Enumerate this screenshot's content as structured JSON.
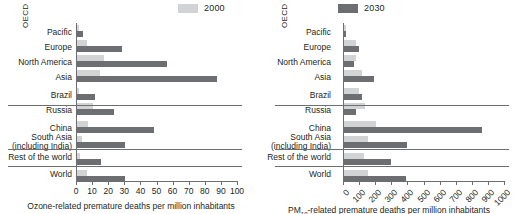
{
  "legend": {
    "items": [
      {
        "label": "2000",
        "color": "#d2d3d5"
      },
      {
        "label": "2030",
        "color": "#6d6e71"
      }
    ]
  },
  "group_label": "OECD",
  "categories": [
    "Pacific",
    "Europe",
    "North America",
    "Asia",
    "Brazil",
    "Russia",
    "China",
    "South Asia\n(including India)",
    "Rest of the world",
    "World"
  ],
  "chart_data": [
    {
      "type": "bar",
      "orientation": "horizontal",
      "title": "",
      "xlabel": "Ozone-related premature deaths per million inhabitants",
      "ylabel": "",
      "xlim": [
        0,
        100
      ],
      "xticks": [
        0,
        10,
        20,
        30,
        40,
        50,
        60,
        70,
        80,
        90,
        100
      ],
      "grid": false,
      "legend_position": "top",
      "categories": [
        "Pacific",
        "Europe",
        "North America",
        "Asia",
        "Brazil",
        "Russia",
        "China",
        "South Asia (including India)",
        "Rest of the world",
        "World"
      ],
      "series": [
        {
          "name": "2000",
          "color": "#d2d3d5",
          "values": [
            1,
            6,
            17,
            14,
            1,
            10,
            7,
            3,
            2,
            6
          ]
        },
        {
          "name": "2030",
          "color": "#6d6e71",
          "values": [
            4,
            28,
            56,
            87,
            11,
            23,
            48,
            30,
            15,
            30
          ]
        }
      ]
    },
    {
      "type": "bar",
      "orientation": "horizontal",
      "title": "",
      "xlabel": "PM10-related premature deaths per million inhabitants",
      "xlabel_rich": {
        "prefix": "PM",
        "sub": "10",
        "suffix": "-related premature deaths per million inhabitants"
      },
      "ylabel": "",
      "xlim": [
        0,
        1000
      ],
      "xticks": [
        0,
        100,
        200,
        300,
        400,
        500,
        600,
        700,
        800,
        900,
        1000
      ],
      "grid": false,
      "legend_position": "top",
      "categories": [
        "Pacific",
        "Europe",
        "North America",
        "Asia",
        "Brazil",
        "Russia",
        "China",
        "South Asia (including India)",
        "Rest of the world",
        "World"
      ],
      "series": [
        {
          "name": "2000",
          "color": "#d2d3d5",
          "values": [
            10,
            75,
            75,
            110,
            95,
            130,
            200,
            150,
            125,
            150
          ]
        },
        {
          "name": "2030",
          "color": "#6d6e71",
          "values": [
            12,
            95,
            65,
            185,
            110,
            75,
            860,
            390,
            290,
            385
          ]
        }
      ]
    }
  ]
}
